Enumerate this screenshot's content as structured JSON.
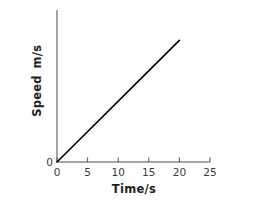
{
  "chart_data": {
    "type": "line",
    "title": "",
    "xlabel": "Time/s",
    "ylabel_line1": "Speed",
    "ylabel_line2": "m/s",
    "xlim": [
      0,
      25
    ],
    "ylim": [
      0,
      25
    ],
    "xticks": [
      0,
      5,
      10,
      15,
      20,
      25
    ],
    "xtick_labels": [
      "0",
      "5",
      "10",
      "15",
      "20",
      "25"
    ],
    "yticks": [
      0
    ],
    "ytick_labels": [
      "0"
    ],
    "grid": false,
    "legend": null,
    "series": [
      {
        "name": "speed",
        "color": "#000000",
        "x": [
          0,
          20
        ],
        "y": [
          0,
          20
        ],
        "style": "solid"
      }
    ]
  },
  "axes": {
    "line_color": "#4d4d4d",
    "tick_color": "#4d4d4d",
    "data_color": "#000000"
  }
}
